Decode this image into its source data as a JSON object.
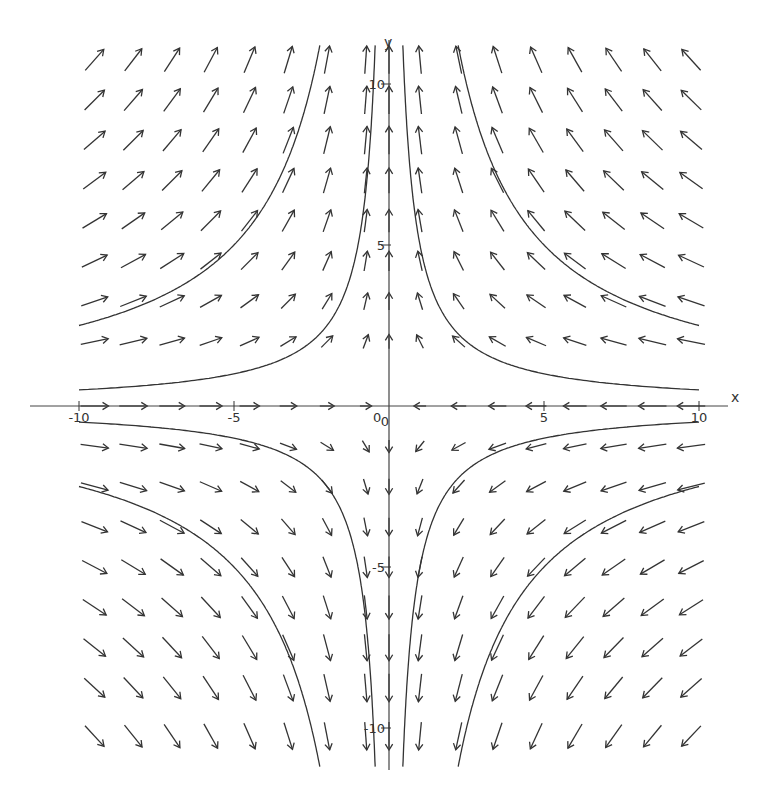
{
  "chart_data": {
    "type": "vector_field",
    "title": "",
    "xlabel": "x",
    "ylabel": "y",
    "xlim": [
      -10,
      10
    ],
    "ylim": [
      -11.2,
      11.2
    ],
    "grid": false,
    "legend": null,
    "field": {
      "u": "-x",
      "v": "y",
      "description": "saddle point at origin; arrows point toward y-axis horizontally and away from x-axis vertically"
    },
    "arrow_grid": {
      "x": [
        -9.5,
        -8.25,
        -7.0,
        -5.75,
        -4.5,
        -3.25,
        -2.0,
        -0.75,
        0.0,
        1.0,
        2.25,
        3.5,
        4.75,
        6.0,
        7.25,
        8.5,
        9.75
      ],
      "y": [
        10.75,
        9.5,
        8.25,
        7.0,
        5.75,
        4.5,
        3.25,
        2.0,
        0.0,
        -1.25,
        -2.5,
        -3.75,
        -5.0,
        -6.25,
        -7.5,
        -8.75,
        -10.25
      ]
    },
    "solution_curves": [
      {
        "equation": "x*y = -5",
        "branch": "upper-left"
      },
      {
        "equation": "x*y = -25",
        "branch": "upper-left"
      },
      {
        "equation": "x*y = 5",
        "branch": "upper-right"
      },
      {
        "equation": "x*y = 25",
        "branch": "upper-right"
      },
      {
        "equation": "x*y = 5",
        "branch": "lower-left"
      },
      {
        "equation": "x*y = 25",
        "branch": "lower-left"
      },
      {
        "equation": "x*y = -5",
        "branch": "lower-right"
      },
      {
        "equation": "x*y = -25",
        "branch": "lower-right"
      }
    ],
    "x_ticks": [
      {
        "value": -10,
        "label": "-10"
      },
      {
        "value": -5,
        "label": "-5"
      },
      {
        "value": 0,
        "label": "0"
      },
      {
        "value": 5,
        "label": "5"
      },
      {
        "value": 10,
        "label": "10"
      }
    ],
    "y_ticks": [
      {
        "value": 10,
        "label": "10"
      },
      {
        "value": 5,
        "label": "5"
      },
      {
        "value": 0,
        "label": "0"
      },
      {
        "value": -5,
        "label": "-5"
      },
      {
        "value": -10,
        "label": "-10"
      }
    ],
    "colors": {
      "ink": "#333333",
      "background": "#ffffff"
    }
  },
  "axes": {
    "x_name": "x",
    "y_name": "y"
  }
}
